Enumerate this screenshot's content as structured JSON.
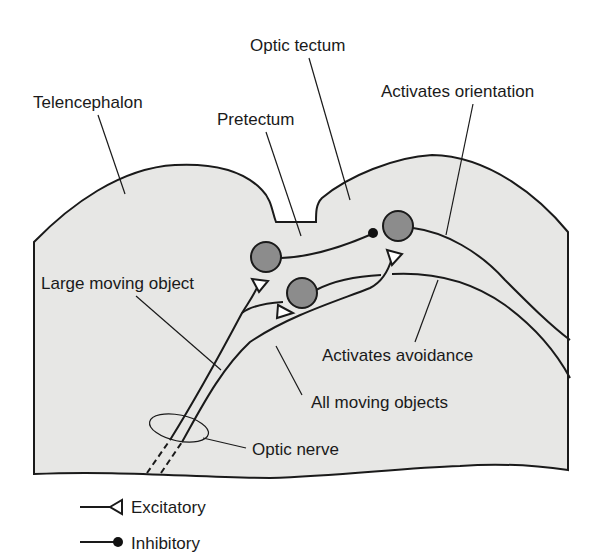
{
  "diagram": {
    "regions": {
      "telencephalon": "Telencephalon",
      "optic_tectum": "Optic tectum",
      "pretectum": "Pretectum"
    },
    "pathways": {
      "activates_orientation": "Activates orientation",
      "large_moving_object": "Large moving object",
      "activates_avoidance": "Activates avoidance",
      "all_moving_objects": "All moving objects",
      "optic_nerve": "Optic nerve"
    },
    "legend": {
      "excitatory": "Excitatory",
      "inhibitory": "Inhibitory"
    },
    "colors": {
      "brain_fill": "#e7e7e5",
      "neuron_fill": "#8c8c8c",
      "line": "#1a1a1a",
      "background": "#ffffff"
    },
    "neurons": [
      {
        "id": "pretectal-neuron",
        "cx": 266,
        "cy": 257,
        "r": 15
      },
      {
        "id": "tectal-avoidance-neuron",
        "cx": 302,
        "cy": 293,
        "r": 15
      },
      {
        "id": "tectal-orientation-neuron",
        "cx": 398,
        "cy": 226,
        "r": 15
      }
    ],
    "synapses": [
      {
        "type": "inhibitory",
        "symbol": "filled-dot",
        "at": "tectal-orientation-neuron"
      },
      {
        "type": "excitatory",
        "symbol": "open-triangle",
        "at": "pretectal-neuron"
      },
      {
        "type": "excitatory",
        "symbol": "open-triangle",
        "at": "tectal-avoidance-neuron"
      },
      {
        "type": "excitatory",
        "symbol": "open-triangle",
        "at": "tectal-orientation-neuron"
      }
    ]
  }
}
